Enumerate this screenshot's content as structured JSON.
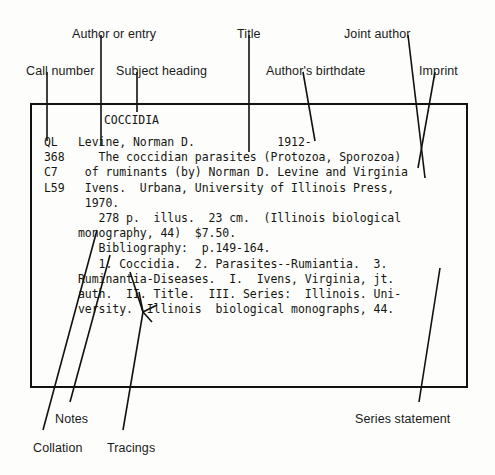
{
  "diagram": {
    "callouts": [
      {
        "id": "author-or-entry",
        "label": "Author or entry",
        "x": 72,
        "y": 27
      },
      {
        "id": "title",
        "label": "Title",
        "x": 237,
        "y": 27
      },
      {
        "id": "joint-author",
        "label": "Joint author",
        "x": 344,
        "y": 27
      },
      {
        "id": "call-number",
        "label": "Call number",
        "x": 26,
        "y": 64
      },
      {
        "id": "subject-heading",
        "label": "Subject heading",
        "x": 116,
        "y": 64
      },
      {
        "id": "authors-birthdate",
        "label": "Author's birthdate",
        "x": 266,
        "y": 64
      },
      {
        "id": "imprint",
        "label": "Imprint",
        "x": 419,
        "y": 64
      },
      {
        "id": "notes",
        "label": "Notes",
        "x": 55,
        "y": 412
      },
      {
        "id": "series-statement",
        "label": "Series statement",
        "x": 355,
        "y": 412
      },
      {
        "id": "collation",
        "label": "Collation",
        "x": 33,
        "y": 441
      },
      {
        "id": "tracings",
        "label": "Tracings",
        "x": 107,
        "y": 441
      }
    ]
  },
  "card": {
    "subject_heading": "COCCIDIA",
    "call_number_lines": [
      "QL",
      "368",
      "C7",
      "L59"
    ],
    "body_lines": [
      "Levine, Norman D.            1912-",
      "   The coccidian parasites (Protozoa, Sporozoa)",
      " of ruminants (by) Norman D. Levine and Virginia",
      " Ivens.  Urbana, University of Illinois Press,",
      " 1970.",
      "   278 p.  illus.  23 cm.  (Illinois biological",
      "monography, 44)  $7.50.",
      "   Bibliography:  p.149-164.",
      "   1. Coccidia.  2. Parasites--Rumiantia.  3.",
      "Ruminantia-Diseases.  I.  Ivens, Virginia, jt.",
      "auth.  II. Title.  III. Series:  Illinois. Uni-",
      "versity.  Illinois  biological monographs, 44."
    ]
  },
  "colors": {
    "ink": "#111110",
    "card_border": "#111110",
    "background": "#fdfdfc",
    "label_text": "#1a1a18"
  }
}
